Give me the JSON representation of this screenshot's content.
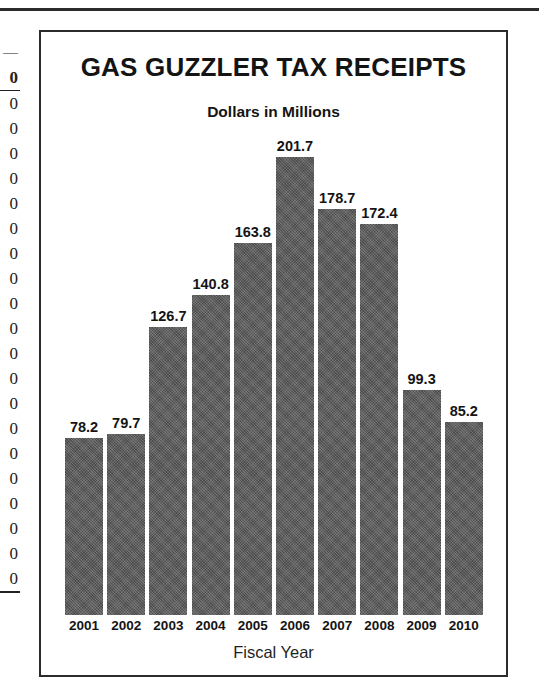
{
  "page": {
    "edge_column": {
      "note": "cropped right edge of an adjacent numeric table column",
      "dash": "—",
      "bold_zero": "0",
      "zeros": [
        "0",
        "0",
        "0",
        "0",
        "0",
        "0",
        "0",
        "0",
        "0",
        "0",
        "0",
        "0",
        "0",
        "0",
        "0",
        "0",
        "0",
        "0",
        "0",
        "0"
      ]
    }
  },
  "chart_data": {
    "type": "bar",
    "title": "GAS GUZZLER TAX RECEIPTS",
    "subtitle": "Dollars in Millions",
    "xlabel": "Fiscal Year",
    "ylabel": "",
    "categories": [
      "2001",
      "2002",
      "2003",
      "2004",
      "2005",
      "2006",
      "2007",
      "2008",
      "2009",
      "2010"
    ],
    "values": [
      78.2,
      79.7,
      126.7,
      140.8,
      163.8,
      201.7,
      178.7,
      172.4,
      99.3,
      85.2
    ],
    "value_labels": [
      "78.2",
      "79.7",
      "126.7",
      "140.8",
      "163.8",
      "201.7",
      "178.7",
      "172.4",
      "99.3",
      "85.2"
    ],
    "ylim": [
      0,
      215
    ],
    "grid": false,
    "legend": null,
    "bar_color": "#5a5a5a",
    "units": "millions of dollars"
  }
}
